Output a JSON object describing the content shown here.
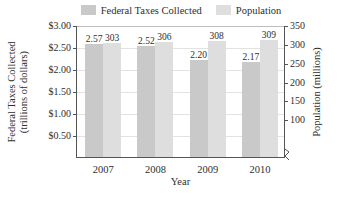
{
  "chart_data": {
    "type": "bar",
    "title": "",
    "categories": [
      "2007",
      "2008",
      "2009",
      "2010"
    ],
    "xlabel": "Year",
    "grid": true,
    "legend_position": "top",
    "series": [
      {
        "name": "Federal Taxes Collected",
        "axis": "left",
        "color": "#c9c9c9",
        "values": [
          2.57,
          2.52,
          2.2,
          2.17
        ],
        "value_labels": [
          "2.57",
          "2.52",
          "2.20",
          "2.17"
        ]
      },
      {
        "name": "Population",
        "axis": "right",
        "color": "#dedede",
        "values": [
          303,
          306,
          308,
          309
        ],
        "value_labels": [
          "303",
          "306",
          "308",
          "309"
        ]
      }
    ],
    "left_axis": {
      "label_line1": "Federal Taxes Collected",
      "label_line2": "(trillions of dollars)",
      "ticks": [
        "$3.00",
        "$2.50",
        "$2.00",
        "$1.50",
        "$1.00",
        "$0.50"
      ],
      "tick_values": [
        3.0,
        2.5,
        2.0,
        1.5,
        1.0,
        0.5
      ],
      "ylim": [
        0.0,
        3.0
      ]
    },
    "right_axis": {
      "label": "Population (millions)",
      "ticks": [
        "350",
        "300",
        "250",
        "200",
        "150",
        "100"
      ],
      "tick_values": [
        350,
        300,
        250,
        200,
        150,
        100
      ],
      "ylim": [
        0,
        350
      ],
      "axis_break": true
    }
  },
  "legend": {
    "entries": [
      {
        "label": "Federal Taxes Collected",
        "swatch": "#c9c9c9"
      },
      {
        "label": "Population",
        "swatch": "#dedede"
      }
    ]
  }
}
